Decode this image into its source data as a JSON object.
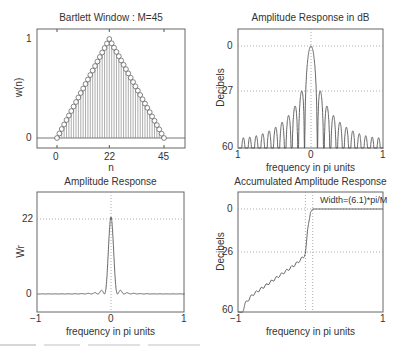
{
  "figure": {
    "caption_partial": "frequency in pi units",
    "panels": [
      {
        "id": "bartlett-window",
        "title": "Bartlett Window : M=45",
        "xlabel": "n",
        "ylabel": "w(n)",
        "xticks": [
          "0",
          "22",
          "45"
        ],
        "yticks": [
          "0",
          "1"
        ]
      },
      {
        "id": "amplitude-db",
        "title": "Amplitude Response in dB",
        "xlabel": "frequency in pi units",
        "ylabel": "Decibels",
        "xticks": [
          "1",
          "0",
          "1"
        ],
        "yticks": [
          "0",
          "27",
          "60"
        ]
      },
      {
        "id": "amplitude",
        "title": "Amplitude Response",
        "xlabel": "frequency in pi units",
        "ylabel": "Wr",
        "xticks": [
          "−1",
          "0",
          "1"
        ],
        "yticks": [
          "22",
          "0"
        ]
      },
      {
        "id": "accumulated",
        "title": "Accumulated Amplitude Response",
        "xlabel": "frequency in pi units",
        "ylabel": "Decibels",
        "xticks": [
          "−1",
          "1"
        ],
        "yticks": [
          "0",
          "26",
          "60"
        ],
        "annotation": "Width=(6.1)*pi/M"
      }
    ]
  },
  "chart_data": [
    {
      "type": "stem",
      "title": "Bartlett Window : M=45",
      "xlabel": "n",
      "ylabel": "w(n)",
      "xlim": [
        -5,
        50
      ],
      "ylim": [
        -0.1,
        1.1
      ],
      "xticks": [
        0,
        22,
        45
      ],
      "yticks": [
        0,
        1
      ],
      "x": "0..45",
      "values_formula": "w(n)=1-|n-22|/22 (triangular, peak 1 at n=22)",
      "grid": false
    },
    {
      "type": "line",
      "title": "Amplitude Response in dB",
      "xlabel": "frequency in pi units",
      "ylabel": "Decibels",
      "xlim": [
        -1,
        1
      ],
      "ylim": [
        -60,
        0
      ],
      "yticks_display": [
        "0",
        "27",
        "60"
      ],
      "mainlobe_peak_db": 0,
      "first_sidelobe_db": -27,
      "sidelobe_floor_db": -52,
      "grid": "dotted at 0, 27 and x=0"
    },
    {
      "type": "line",
      "title": "Amplitude Response",
      "xlabel": "frequency in pi units",
      "ylabel": "Wr",
      "xlim": [
        -1,
        1
      ],
      "ylim": [
        -4,
        30
      ],
      "yticks": [
        0,
        22
      ],
      "peak": {
        "x": 0,
        "y": 22
      },
      "mainlobe_halfwidth_pi": 0.09,
      "grid": "dotted at y=22 and x=0"
    },
    {
      "type": "line",
      "title": "Accumulated Amplitude Response",
      "xlabel": "frequency in pi units",
      "ylabel": "Decibels",
      "xlim": [
        -1,
        1
      ],
      "ylim": [
        -60,
        0
      ],
      "yticks_display": [
        "0",
        "26",
        "60"
      ],
      "annotation": "Width=(6.1)*pi/M",
      "points": [
        [
          -0.94,
          -60
        ],
        [
          -0.9,
          -55
        ],
        [
          -0.8,
          -50
        ],
        [
          -0.6,
          -44
        ],
        [
          -0.4,
          -38
        ],
        [
          -0.2,
          -32
        ],
        [
          -0.1,
          -28
        ],
        [
          -0.07,
          -26
        ],
        [
          -0.04,
          -12
        ],
        [
          0.0,
          -2
        ],
        [
          0.03,
          0
        ],
        [
          1.0,
          0
        ]
      ],
      "grid": "dotted at 0, 26 and x=-0.07, x=0.03"
    }
  ]
}
